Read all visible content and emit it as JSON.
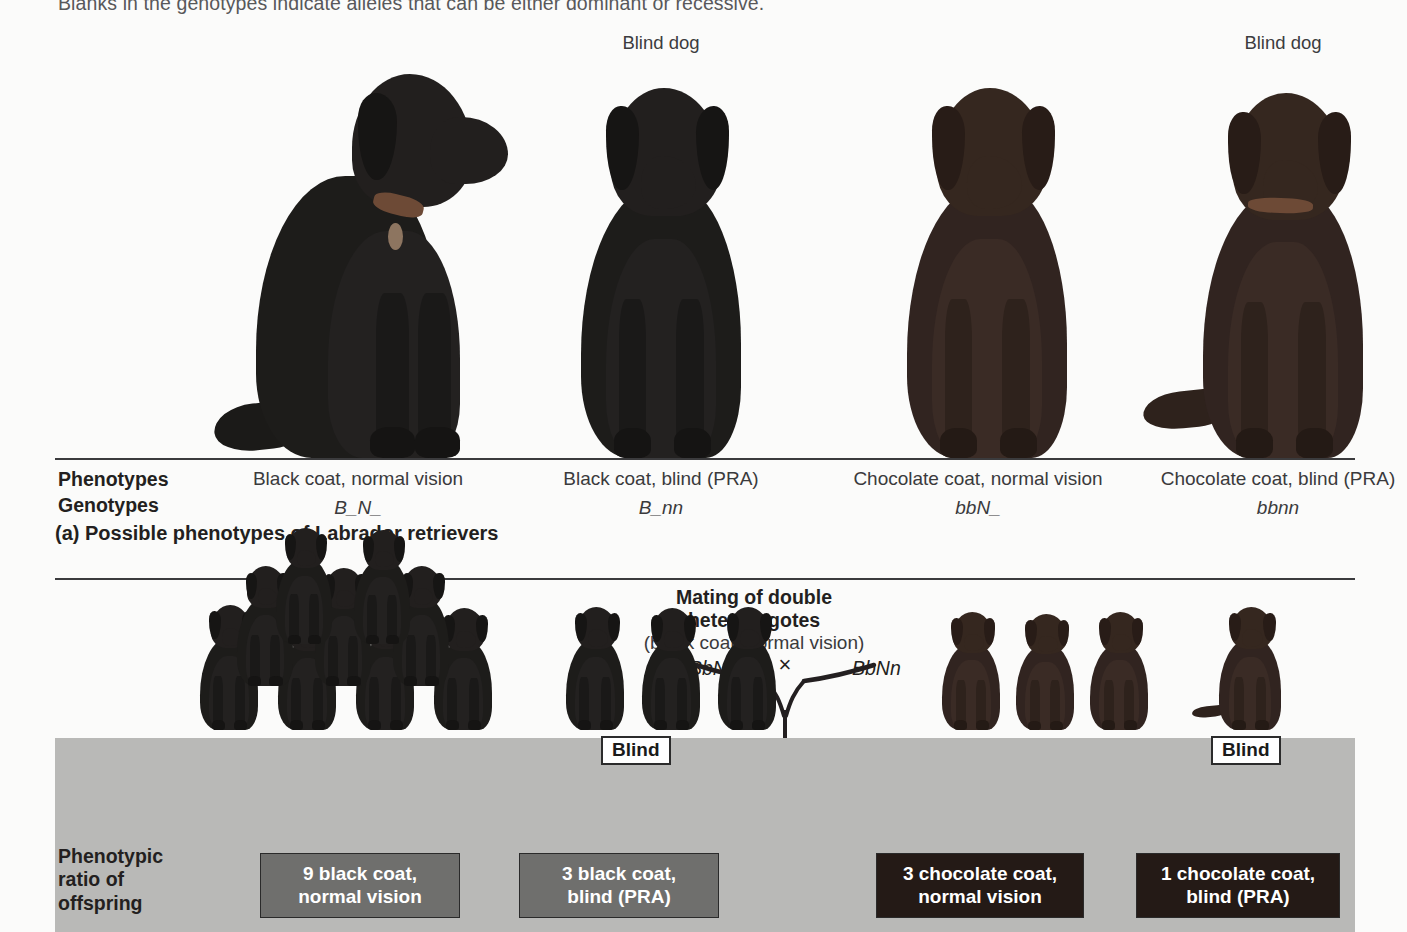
{
  "figure": {
    "intro_note": "Blanks in the genotypes indicate alleles that can be either dominant or recessive.",
    "part_a_caption": "(a) Possible phenotypes of Labrador retrievers",
    "row_labels": {
      "phenotypes": "Phenotypes",
      "genotypes": "Genotypes",
      "ratio": "Phenotypic ratio of offspring"
    },
    "blind_dog_label": "Blind dog"
  },
  "part_a": {
    "columns": [
      {
        "phenotype": "Black coat, normal vision",
        "genotype": "B_N_",
        "blind_label": "",
        "coat": "black",
        "pose": "side"
      },
      {
        "phenotype": "Black coat, blind (PRA)",
        "genotype": "B_nn",
        "blind_label": "Blind dog",
        "coat": "black",
        "pose": "front"
      },
      {
        "phenotype": "Chocolate coat, normal vision",
        "genotype": "bbN_",
        "blind_label": "",
        "coat": "chocolate",
        "pose": "front"
      },
      {
        "phenotype": "Chocolate coat, blind (PRA)",
        "genotype": "bbnn",
        "blind_label": "Blind dog",
        "coat": "chocolate",
        "pose": "front"
      }
    ]
  },
  "part_b": {
    "mating_title_line1": "Mating of double",
    "mating_title_line2": "heterozygotes",
    "mating_subtitle": "(black coat, normal vision)",
    "parent_left_genotype": "BbNn",
    "parent_right_genotype": "BbNn",
    "cross_symbol": "×",
    "offspring_groups": [
      {
        "count": 9,
        "box_line1": "9 black coat,",
        "box_line2": "normal vision",
        "box_color": "#6f6f6d",
        "coat": "black",
        "blind_callout": ""
      },
      {
        "count": 3,
        "box_line1": "3 black coat,",
        "box_line2": "blind (PRA)",
        "box_color": "#6f6f6d",
        "coat": "black",
        "blind_callout": "Blind"
      },
      {
        "count": 3,
        "box_line1": "3 chocolate coat,",
        "box_line2": "normal vision",
        "box_color": "#241a16",
        "coat": "chocolate",
        "blind_callout": ""
      },
      {
        "count": 1,
        "box_line1": "1 chocolate coat,",
        "box_line2": "blind (PRA)",
        "box_color": "#241a16",
        "coat": "chocolate",
        "blind_callout": "Blind"
      }
    ]
  },
  "colors": {
    "page_background": "#fbfbfa",
    "band_background": "#b9b9b7",
    "rule_color": "#3b3b3d",
    "text_color": "#231f20",
    "muted_text": "#58585a"
  }
}
